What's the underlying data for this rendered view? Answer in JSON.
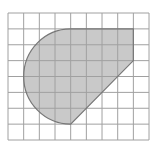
{
  "diagram": {
    "type": "grid-shape",
    "grid": {
      "columns": 9,
      "rows": 8,
      "origin_x": 8,
      "origin_y": 13,
      "cell_width": 15.67,
      "cell_height": 15.875,
      "line_color": "#a0a0a0"
    },
    "shape": {
      "description": "Shaded figure composed of a semicircle (left) joined to a trapezoid-like polygon (right) with a diagonal edge",
      "fill_color": "#c9c9c9",
      "stroke_color": "#777777",
      "vertices_grid": [
        [
          4,
          1
        ],
        [
          8,
          1
        ],
        [
          8,
          3
        ],
        [
          4,
          7
        ]
      ],
      "arc": {
        "center_grid": [
          4,
          4
        ],
        "radius_cells": 3,
        "from_grid": [
          4,
          1
        ],
        "to_grid": [
          4,
          7
        ],
        "side": "left"
      }
    }
  }
}
